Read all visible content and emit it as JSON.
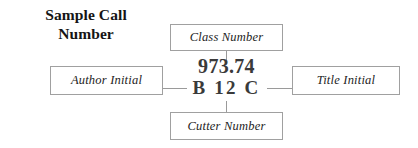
{
  "diagram": {
    "heading": {
      "line1": "Sample Call",
      "line2": "Number"
    },
    "call_number": {
      "class_line": "973.74",
      "cutter_line": "B 12 C"
    },
    "labels": {
      "class_number": "Class Number",
      "author_initial": "Author Initial",
      "title_initial": "Title Initial",
      "cutter_number": "Cutter Number"
    },
    "colors": {
      "background": "#ffffff",
      "box_border": "#a0a0a0",
      "connector": "#9a9a9a",
      "heading_text": "#151515",
      "label_text": "#232323",
      "call_number_text": "#3a3a3a"
    }
  }
}
